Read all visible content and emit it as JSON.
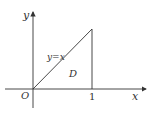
{
  "diagram": {
    "axes": {
      "x_label": "x",
      "y_label": "y",
      "origin_label": "O"
    },
    "tick_labels": {
      "x_tick": "1"
    },
    "line_label": "y=x",
    "region_label": "D",
    "colors": {
      "stroke": "#333333",
      "background": "#ffffff"
    }
  }
}
